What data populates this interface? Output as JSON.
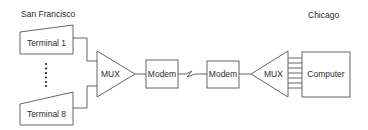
{
  "diagram": {
    "locations": {
      "left": "San Francisco",
      "right": "Chicago"
    },
    "nodes": {
      "terminal_1": "Terminal 1",
      "terminal_8": "Terminal 8",
      "mux_left": "MUX",
      "modem_left": "Modem",
      "modem_right": "Modem",
      "mux_right": "MUX",
      "computer": "Computer"
    },
    "ellipsis_dots": 6,
    "computer_input_lines": 7,
    "edges": [
      {
        "from": "Terminal 1",
        "to": "MUX"
      },
      {
        "from": "Terminal 8",
        "to": "MUX"
      },
      {
        "from": "MUX",
        "to": "Modem"
      },
      {
        "from": "Modem",
        "to": "Modem",
        "type": "telephone-line"
      },
      {
        "from": "Modem",
        "to": "MUX"
      },
      {
        "from": "MUX",
        "to": "Computer",
        "type": "parallel-lines"
      }
    ],
    "colors": {
      "stroke": "#555555",
      "text": "#2a2a2a",
      "background": "#ffffff"
    }
  }
}
